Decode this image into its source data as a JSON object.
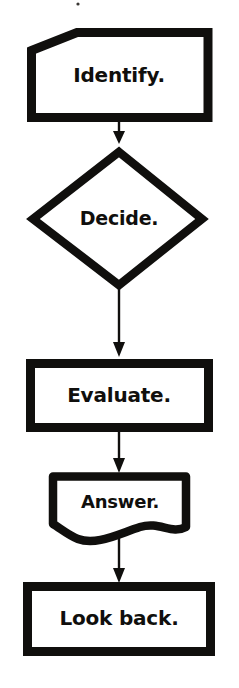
{
  "diagram": {
    "orientation": "vertical-top-to-bottom",
    "background_color": "#ffffff",
    "ink_color": "#100f0d",
    "nodes": [
      {
        "id": "identify",
        "label": "Identify.",
        "shape": "pentagon-clipped-corner",
        "font_size": 20
      },
      {
        "id": "decide",
        "label": "Decide.",
        "shape": "diamond",
        "font_size": 19
      },
      {
        "id": "evaluate",
        "label": "Evaluate.",
        "shape": "rectangle",
        "font_size": 20
      },
      {
        "id": "answer",
        "label": "Answer.",
        "shape": "document-wavy-bottom",
        "font_size": 18
      },
      {
        "id": "lookback",
        "label": "Look back.",
        "shape": "rectangle",
        "font_size": 20
      }
    ],
    "connectors": [
      {
        "id": "identify-to-decide",
        "from": "identify",
        "to": "decide",
        "arrow": "down"
      },
      {
        "id": "decide-to-evaluate",
        "from": "decide",
        "to": "evaluate",
        "arrow": "down"
      },
      {
        "id": "evaluate-to-answer",
        "from": "evaluate",
        "to": "answer",
        "arrow": "down"
      },
      {
        "id": "answer-to-lookback",
        "from": "answer",
        "to": "lookback",
        "arrow": "down"
      }
    ]
  }
}
